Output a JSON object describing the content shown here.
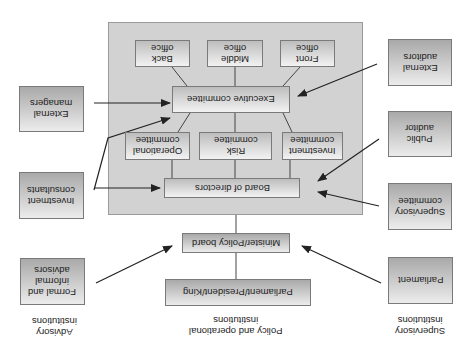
{
  "orientation": "rotated 180 degrees",
  "columns": {
    "advisory": "Advisory\ninstitutions",
    "policy": "Policy and operational\ninstitutions",
    "supervisory": "Supervisory\ninstitutions"
  },
  "central_panel": {
    "offices": {
      "back": "Back\noffice",
      "middle": "Middle\noffice",
      "front": "Front\noffice"
    },
    "executive_committee": "Executive committee",
    "committees": {
      "operational": "Operational\ncommittee",
      "risk": "Risk\ncommittee",
      "investment": "Investment\ncommittee"
    },
    "board": "Board of directors"
  },
  "policy_chain": {
    "minister": "Minister/Policy board",
    "parliament_president_king": "Parliament/President/King"
  },
  "advisory_boxes": {
    "external_managers": "External\nmanagers",
    "investment_consultants": "Investment\nconsultants",
    "formal_informal_advisors": "Formal and\ninformal\nadvisors"
  },
  "supervisory_boxes": {
    "external_auditors": "External\nauditors",
    "public_auditor": "Public\nauditor",
    "supervisory_committee": "Supervisory\ncommittee",
    "parliament": "Parliament"
  }
}
